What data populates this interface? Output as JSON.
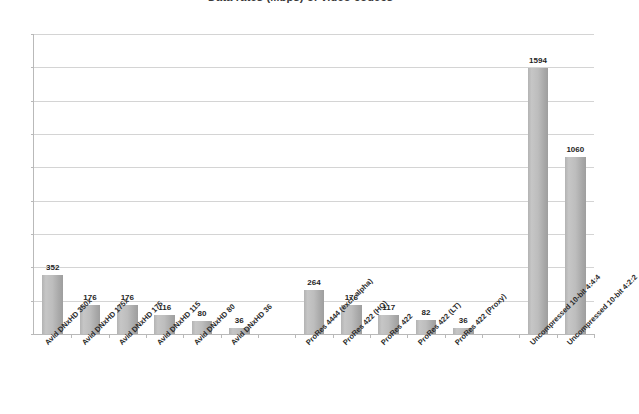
{
  "chart_data": {
    "type": "bar",
    "title": "Data rates (Mbps) of video codecs",
    "xlabel": "",
    "ylabel": "",
    "ylim": [
      0,
      1800
    ],
    "ytick_step": 200,
    "yticks": [
      0,
      200,
      400,
      600,
      800,
      1000,
      1200,
      1400,
      1600,
      1800
    ],
    "ytick_labels": [
      "0",
      "200",
      "400",
      "600",
      "800",
      "1000",
      "1200",
      "1400",
      "1600",
      "1800"
    ],
    "grid": true,
    "legend": false,
    "bar_color": "#b5b5b5",
    "categories": [
      "Avid DNxHD 350x",
      "Avid DNxHD 175x",
      "Avid DNxHD 175",
      "Avid DNxHD 115",
      "Avid DNxHD 80",
      "Avid DNxHD 36",
      "",
      "ProRes 4444 (excl. alpha)",
      "ProRes 422 (HQ)",
      "ProRes 422",
      "ProRes 422 (LT)",
      "ProRes 422 (Proxy)",
      "",
      "Uncompressed 10-bit 4:4:4",
      "Uncompressed 10-bit 4:2:2"
    ],
    "values": [
      352,
      176,
      176,
      116,
      80,
      36,
      null,
      264,
      176,
      117,
      82,
      36,
      null,
      1594,
      1060
    ],
    "value_labels": [
      "352",
      "176",
      "176",
      "116",
      "80",
      "36",
      "",
      "264",
      "176",
      "117",
      "82",
      "36",
      "",
      "1594",
      "1060"
    ]
  }
}
